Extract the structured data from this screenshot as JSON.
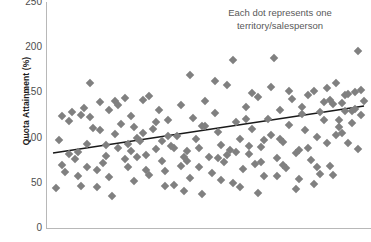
{
  "chart_data": {
    "type": "scatter",
    "title": "",
    "xlabel": "",
    "ylabel": "Quota Attainment (%)",
    "ylim": [
      0,
      250
    ],
    "yticks": [
      0,
      50,
      100,
      150,
      200,
      250
    ],
    "xlim": [
      0,
      100
    ],
    "grid": false,
    "legend": null,
    "annotation": "Each dot represents one territory/salesperson",
    "annotation_line1": "Each dot represents one",
    "annotation_line2": "territory/salesperson",
    "marker": {
      "shape": "diamond",
      "color": "#808080",
      "size": 6
    },
    "trendline": {
      "color": "#1a1a1a",
      "x0": 0,
      "y0": 83,
      "x1": 100,
      "y1": 135
    },
    "points": [
      [
        1,
        44
      ],
      [
        2,
        97
      ],
      [
        3,
        70
      ],
      [
        4,
        62
      ],
      [
        5,
        118
      ],
      [
        6,
        128
      ],
      [
        7,
        76
      ],
      [
        8,
        84
      ],
      [
        9,
        46
      ],
      [
        10,
        133
      ],
      [
        11,
        93
      ],
      [
        12,
        123
      ],
      [
        13,
        111
      ],
      [
        14,
        64
      ],
      [
        15,
        139
      ],
      [
        16,
        72
      ],
      [
        17,
        80
      ],
      [
        18,
        56
      ],
      [
        19,
        35
      ],
      [
        20,
        104
      ],
      [
        21,
        88
      ],
      [
        22,
        115
      ],
      [
        23,
        76
      ],
      [
        24,
        67
      ],
      [
        25,
        124
      ],
      [
        26,
        52
      ],
      [
        27,
        100
      ],
      [
        28,
        96
      ],
      [
        29,
        142
      ],
      [
        30,
        81
      ],
      [
        31,
        59
      ],
      [
        32,
        110
      ],
      [
        33,
        87
      ],
      [
        34,
        130
      ],
      [
        35,
        74
      ],
      [
        36,
        63
      ],
      [
        37,
        119
      ],
      [
        38,
        91
      ],
      [
        39,
        48
      ],
      [
        40,
        102
      ],
      [
        41,
        136
      ],
      [
        42,
        78
      ],
      [
        43,
        85
      ],
      [
        44,
        55
      ],
      [
        45,
        122
      ],
      [
        46,
        98
      ],
      [
        47,
        68
      ],
      [
        48,
        113
      ],
      [
        49,
        140
      ],
      [
        50,
        79
      ],
      [
        51,
        61
      ],
      [
        52,
        127
      ],
      [
        53,
        106
      ],
      [
        54,
        92
      ],
      [
        55,
        73
      ],
      [
        56,
        158
      ],
      [
        57,
        86
      ],
      [
        58,
        50
      ],
      [
        59,
        117
      ],
      [
        60,
        99
      ],
      [
        61,
        65
      ],
      [
        62,
        134
      ],
      [
        63,
        82
      ],
      [
        64,
        109
      ],
      [
        65,
        71
      ],
      [
        66,
        145
      ],
      [
        67,
        90
      ],
      [
        68,
        58
      ],
      [
        69,
        121
      ],
      [
        70,
        103
      ],
      [
        71,
        188
      ],
      [
        72,
        77
      ],
      [
        73,
        131
      ],
      [
        74,
        95
      ],
      [
        75,
        66
      ],
      [
        76,
        114
      ],
      [
        77,
        143
      ],
      [
        78,
        83
      ],
      [
        79,
        54
      ],
      [
        80,
        126
      ],
      [
        81,
        108
      ],
      [
        82,
        89
      ],
      [
        83,
        75
      ],
      [
        84,
        152
      ],
      [
        85,
        101
      ],
      [
        86,
        60
      ],
      [
        87,
        120
      ],
      [
        88,
        94
      ],
      [
        89,
        69
      ],
      [
        90,
        137
      ],
      [
        91,
        160
      ],
      [
        92,
        112
      ],
      [
        93,
        105
      ],
      [
        94,
        129
      ],
      [
        95,
        148
      ],
      [
        96,
        116
      ],
      [
        97,
        132
      ],
      [
        98,
        196
      ],
      [
        99,
        125
      ],
      [
        100,
        141
      ],
      [
        12,
        160
      ],
      [
        23,
        144
      ],
      [
        31,
        146
      ],
      [
        39,
        88
      ],
      [
        44,
        169
      ],
      [
        52,
        163
      ],
      [
        58,
        186
      ],
      [
        64,
        149
      ],
      [
        70,
        156
      ],
      [
        76,
        151
      ],
      [
        82,
        147
      ],
      [
        88,
        155
      ],
      [
        93,
        138
      ],
      [
        97,
        150
      ],
      [
        99,
        153
      ],
      [
        9,
        125
      ],
      [
        15,
        108
      ],
      [
        21,
        136
      ],
      [
        27,
        78
      ],
      [
        33,
        117
      ],
      [
        36,
        47
      ],
      [
        42,
        41
      ],
      [
        48,
        38
      ],
      [
        54,
        53
      ],
      [
        60,
        45
      ],
      [
        66,
        39
      ],
      [
        72,
        57
      ],
      [
        78,
        43
      ],
      [
        84,
        49
      ],
      [
        90,
        59
      ],
      [
        5,
        82
      ],
      [
        11,
        68
      ],
      [
        17,
        92
      ],
      [
        25,
        85
      ],
      [
        29,
        105
      ],
      [
        35,
        96
      ],
      [
        41,
        69
      ],
      [
        47,
        88
      ],
      [
        53,
        77
      ],
      [
        59,
        84
      ],
      [
        63,
        91
      ],
      [
        67,
        73
      ],
      [
        73,
        99
      ],
      [
        79,
        86
      ],
      [
        85,
        67
      ],
      [
        91,
        103
      ],
      [
        95,
        94
      ],
      [
        98,
        87
      ],
      [
        20,
        141
      ],
      [
        26,
        112
      ],
      [
        3,
        124
      ],
      [
        8,
        57
      ],
      [
        14,
        45
      ],
      [
        18,
        131
      ],
      [
        24,
        93
      ],
      [
        30,
        64
      ],
      [
        37,
        102
      ],
      [
        43,
        74
      ],
      [
        49,
        113
      ],
      [
        56,
        81
      ],
      [
        62,
        121
      ],
      [
        68,
        97
      ],
      [
        74,
        70
      ],
      [
        80,
        134
      ],
      [
        86,
        128
      ],
      [
        92,
        119
      ],
      [
        96,
        129
      ],
      [
        89,
        142
      ],
      [
        94,
        147
      ],
      [
        87,
        139
      ]
    ]
  }
}
